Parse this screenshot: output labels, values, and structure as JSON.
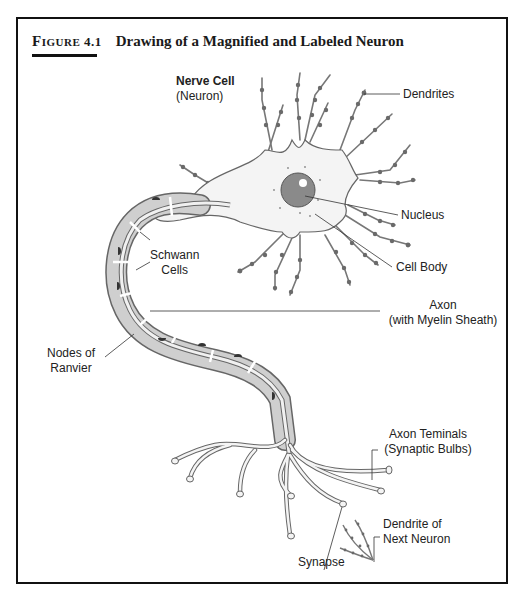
{
  "figure": {
    "number_prefix": "Figure",
    "number": "4.1",
    "title": "Drawing of a Magnified and Labeled Neuron"
  },
  "labels": {
    "nerve_cell": "Nerve Cell",
    "neuron": "(Neuron)",
    "dendrites": "Dendrites",
    "nucleus": "Nucleus",
    "cell_body": "Cell Body",
    "schwann_1": "Schwann",
    "schwann_2": "Cells",
    "axon_1": "Axon",
    "axon_2": "(with Myelin Sheath)",
    "nodes_1": "Nodes of",
    "nodes_2": "Ranvier",
    "terminals_1": "Axon Teminals",
    "terminals_2": "(Synaptic Bulbs)",
    "next_dendrite_1": "Dendrite of",
    "next_dendrite_2": "Next Neuron",
    "synapse": "Synapse"
  },
  "colors": {
    "frame": "#111111",
    "cell_fill": "#f4f4f4",
    "outline": "#555555",
    "myelin": "#cfcfcf",
    "nucleus": "#8a8a8a",
    "dendrite_beads": "#6a6a6a"
  }
}
